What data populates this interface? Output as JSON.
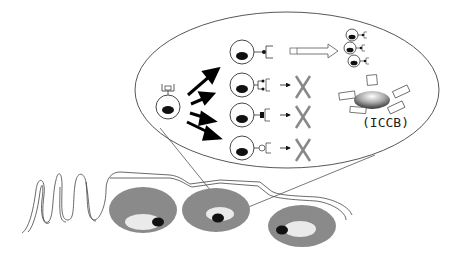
{
  "diagram": {
    "label_iccb": "(ICCB)",
    "colors": {
      "line": "#333333",
      "nucleus": "#111111",
      "cross": "#888888",
      "outer_cell": "#8a8a8a",
      "outer_cell_inner": "#e8e8e8"
    },
    "progenitor_cell": {
      "receptor": "boxed"
    },
    "selection_paths": [
      {
        "id": 1,
        "receptor": "high-affinity",
        "outcome": "expansion"
      },
      {
        "id": 2,
        "receptor": "double-ligand",
        "outcome": "eliminated"
      },
      {
        "id": 3,
        "receptor": "bound-square",
        "outcome": "eliminated"
      },
      {
        "id": 4,
        "receptor": "open-circle",
        "outcome": "eliminated"
      }
    ],
    "expanded_clones": 3,
    "iccb_fragments": 5,
    "tissue_cells": 3
  }
}
